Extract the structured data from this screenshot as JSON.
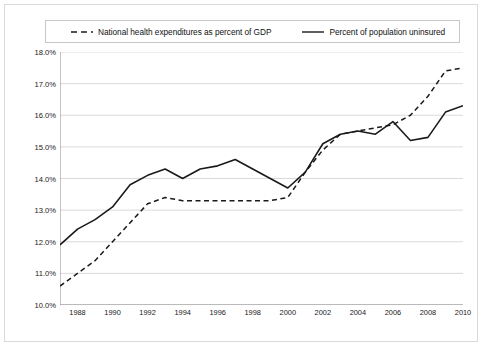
{
  "chart_data": {
    "type": "line",
    "title": "",
    "subtitle": "",
    "xlabel": "",
    "ylabel": "",
    "xlim": [
      1987,
      2010
    ],
    "ylim": [
      10.0,
      18.0
    ],
    "grid": true,
    "legend_position": "top",
    "x": [
      1987,
      1988,
      1989,
      1990,
      1991,
      1992,
      1993,
      1994,
      1995,
      1996,
      1997,
      1998,
      1999,
      2000,
      2001,
      2002,
      2003,
      2004,
      2005,
      2006,
      2007,
      2008,
      2009,
      2010
    ],
    "x_tick_labels": [
      "1988",
      "1990",
      "1992",
      "1994",
      "1996",
      "1998",
      "2000",
      "2002",
      "2004",
      "2006",
      "2008",
      "2010"
    ],
    "x_ticks": [
      1988,
      1990,
      1992,
      1994,
      1996,
      1998,
      2000,
      2002,
      2004,
      2006,
      2008,
      2010
    ],
    "y_tick_labels": [
      "10.0%",
      "11.0%",
      "12.0%",
      "13.0%",
      "14.0%",
      "15.0%",
      "16.0%",
      "17.0%",
      "18.0%"
    ],
    "y_ticks": [
      10.0,
      11.0,
      12.0,
      13.0,
      14.0,
      15.0,
      16.0,
      17.0,
      18.0
    ],
    "series": [
      {
        "name": "National health expenditures as percent of GDP",
        "style": "dashed",
        "color": "#1a1a1a",
        "values": [
          10.6,
          11.0,
          11.4,
          12.0,
          12.6,
          13.2,
          13.4,
          13.3,
          13.3,
          13.3,
          13.3,
          13.3,
          13.3,
          13.4,
          14.2,
          14.9,
          15.4,
          15.5,
          15.6,
          15.7,
          16.0,
          16.6,
          17.4,
          17.5
        ]
      },
      {
        "name": "Percent of population uninsured",
        "style": "solid",
        "color": "#1a1a1a",
        "values": [
          11.9,
          12.4,
          12.7,
          13.1,
          13.8,
          14.1,
          14.3,
          14.0,
          14.3,
          14.4,
          14.6,
          14.3,
          14.0,
          13.7,
          14.2,
          15.1,
          15.4,
          15.5,
          15.4,
          15.8,
          15.2,
          15.3,
          16.1,
          16.3
        ]
      }
    ]
  },
  "legend": {
    "entries": [
      {
        "label": "National health expenditures as percent of GDP",
        "style": "dashed"
      },
      {
        "label": "Percent of population uninsured",
        "style": "solid"
      }
    ]
  }
}
